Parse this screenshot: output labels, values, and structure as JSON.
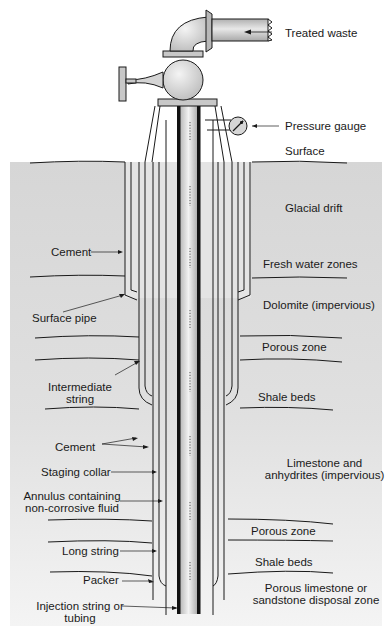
{
  "diagram": {
    "colors": {
      "background": "#ffffff",
      "ground": "#d9d9d9",
      "line": "#1a1a1a",
      "pipe_fill": "#c8c8c8",
      "tubing_core": "#d0d0d0"
    },
    "surface_labels": {
      "treated_waste": "Treated waste",
      "pressure_gauge": "Pressure gauge",
      "surface": "Surface"
    },
    "strata": [
      {
        "id": "glacial-drift",
        "label": "Glacial drift"
      },
      {
        "id": "fresh-water",
        "label": "Fresh water zones"
      },
      {
        "id": "dolomite",
        "label": "Dolomite (impervious)"
      },
      {
        "id": "porous-zone-1",
        "label": "Porous zone"
      },
      {
        "id": "shale-beds-1",
        "label": "Shale beds"
      },
      {
        "id": "limestone-anhydrites",
        "line1": "Limestone and",
        "line2": "anhydrites (impervious)"
      },
      {
        "id": "porous-zone-2",
        "label": "Porous zone"
      },
      {
        "id": "shale-beds-2",
        "label": "Shale beds"
      },
      {
        "id": "disposal-zone",
        "line1": "Porous limestone or",
        "line2": "sandstone disposal zone"
      }
    ],
    "well_components": {
      "cement_upper": "Cement",
      "surface_pipe": "Surface pipe",
      "intermediate_string": {
        "line1": "Intermediate",
        "line2": "string"
      },
      "cement_lower": "Cement",
      "staging_collar": "Staging collar",
      "annulus": {
        "line1": "Annulus containing",
        "line2": "non-corrosive fluid"
      },
      "long_string": "Long string",
      "packer": "Packer",
      "injection_string": {
        "line1": "Injection string or",
        "line2": "tubing"
      }
    }
  }
}
